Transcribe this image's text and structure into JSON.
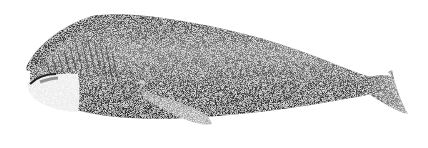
{
  "image": {
    "subject": "bowhead whale",
    "style": "black-and-white stippled scientific illustration",
    "orientation": "facing left",
    "background": "#ffffff"
  },
  "colors": {
    "body_dark": "#2a2a2a",
    "body_mid": "#5a5a5a",
    "body_light": "#9a9a9a",
    "chin_white": "#e8e8e8",
    "outline": "#111111"
  },
  "parts": {
    "head": "arched rostrum with baleen plates",
    "chin": "white lower jaw patch",
    "flipper": "pectoral flipper, lower middle",
    "tail": "flukes at right edge"
  }
}
